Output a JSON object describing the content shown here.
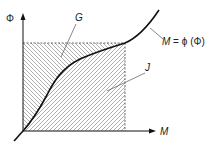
{
  "diagram": {
    "axes": {
      "y_label": "Φ",
      "x_label": "M"
    },
    "regions": [
      {
        "label": "G",
        "hatch": "descending",
        "description": "region between curve and Φ axis"
      },
      {
        "label": "J",
        "hatch": "ascending",
        "description": "region between curve and M axis"
      }
    ],
    "curve": {
      "label_var": "M",
      "label_eq": " = ",
      "label_func": "ϕ",
      "label_arg": " (Φ)"
    },
    "colors": {
      "line": "#111111",
      "hatch": "#8a8a8a",
      "dashed_box": "#444444"
    }
  }
}
